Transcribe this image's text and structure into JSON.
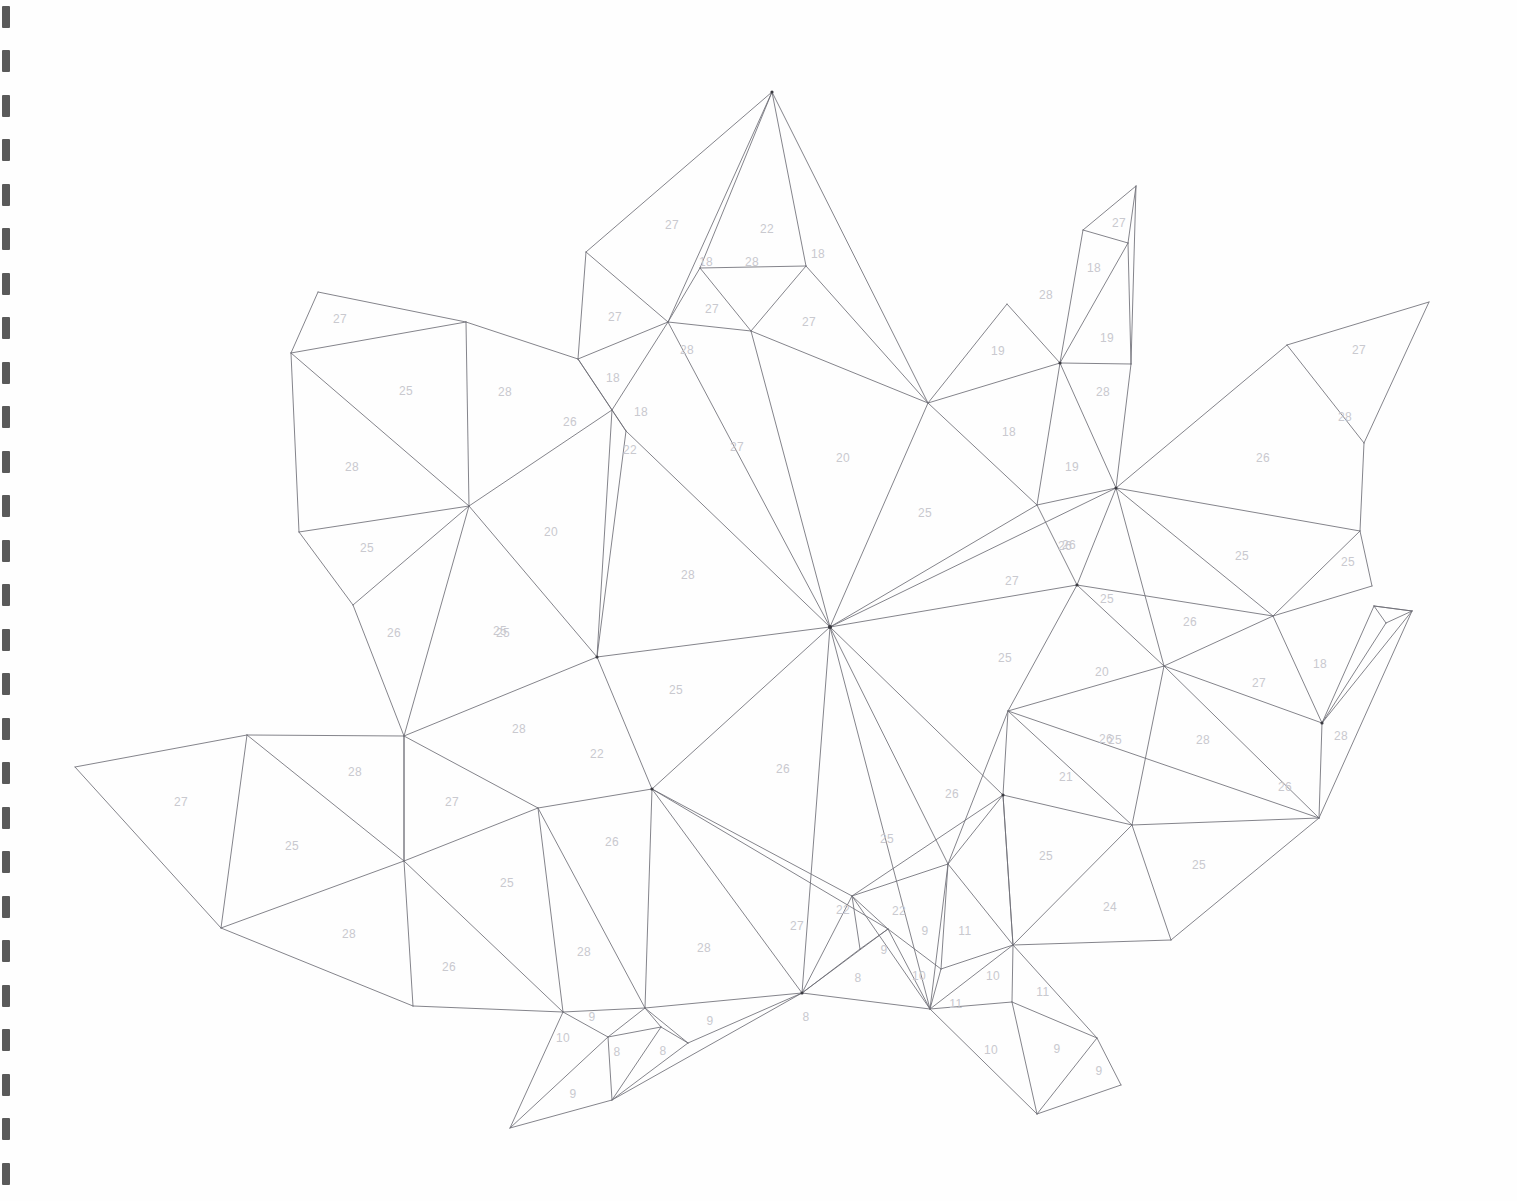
{
  "document": {
    "kind": "low-poly-papercraft-template",
    "subject": "maple-leaf",
    "page_background": "#fefefe",
    "line_color": "#6e6e76",
    "label_color": "#c9c9cf",
    "binding": {
      "side": "left",
      "hole_count": 27,
      "hole_color": "#2b2b2b"
    }
  },
  "chart_data": {
    "type": "diagram",
    "title": "",
    "xlabel": "",
    "ylabel": "",
    "note": "Triangulated unfold pattern; each face carries a numeric fold-group label.",
    "face_labels": [
      {
        "id": "f01",
        "text": "27",
        "x": 672,
        "y": 226
      },
      {
        "id": "f02",
        "text": "22",
        "x": 767,
        "y": 230
      },
      {
        "id": "f03",
        "text": "18",
        "x": 818,
        "y": 255
      },
      {
        "id": "f04",
        "text": "18",
        "x": 706,
        "y": 263
      },
      {
        "id": "f05",
        "text": "28",
        "x": 752,
        "y": 263
      },
      {
        "id": "f06",
        "text": "27",
        "x": 615,
        "y": 318
      },
      {
        "id": "f07",
        "text": "27",
        "x": 712,
        "y": 310
      },
      {
        "id": "f08",
        "text": "27",
        "x": 809,
        "y": 323
      },
      {
        "id": "f09",
        "text": "28",
        "x": 687,
        "y": 351
      },
      {
        "id": "f10",
        "text": "27",
        "x": 340,
        "y": 320
      },
      {
        "id": "f11",
        "text": "25",
        "x": 406,
        "y": 392
      },
      {
        "id": "f12",
        "text": "28",
        "x": 505,
        "y": 393
      },
      {
        "id": "f13",
        "text": "18",
        "x": 613,
        "y": 379
      },
      {
        "id": "f14",
        "text": "26",
        "x": 570,
        "y": 423
      },
      {
        "id": "f15",
        "text": "18",
        "x": 641,
        "y": 413
      },
      {
        "id": "f16",
        "text": "22",
        "x": 630,
        "y": 451
      },
      {
        "id": "f17",
        "text": "28",
        "x": 352,
        "y": 468
      },
      {
        "id": "f18",
        "text": "27",
        "x": 737,
        "y": 448
      },
      {
        "id": "f19",
        "text": "20",
        "x": 843,
        "y": 459
      },
      {
        "id": "f20",
        "text": "25",
        "x": 367,
        "y": 549
      },
      {
        "id": "f21",
        "text": "20",
        "x": 551,
        "y": 533
      },
      {
        "id": "f22",
        "text": "25",
        "x": 925,
        "y": 514
      },
      {
        "id": "f23",
        "text": "26",
        "x": 394,
        "y": 634
      },
      {
        "id": "f24",
        "text": "25",
        "x": 503,
        "y": 634
      },
      {
        "id": "f25",
        "text": "28",
        "x": 688,
        "y": 576
      },
      {
        "id": "f26",
        "text": "25",
        "x": 676,
        "y": 691
      },
      {
        "id": "f27",
        "text": "28",
        "x": 519,
        "y": 730
      },
      {
        "id": "f28",
        "text": "22",
        "x": 597,
        "y": 755
      },
      {
        "id": "f29",
        "text": "26",
        "x": 783,
        "y": 770
      },
      {
        "id": "f30",
        "text": "27",
        "x": 1012,
        "y": 582
      },
      {
        "id": "f31",
        "text": "25",
        "x": 1005,
        "y": 659
      },
      {
        "id": "f32",
        "text": "26",
        "x": 1069,
        "y": 546
      },
      {
        "id": "f33",
        "text": "25",
        "x": 1107,
        "y": 600
      },
      {
        "id": "f34",
        "text": "20",
        "x": 1102,
        "y": 673
      },
      {
        "id": "f35",
        "text": "26",
        "x": 1190,
        "y": 623
      },
      {
        "id": "f36",
        "text": "27",
        "x": 1259,
        "y": 684
      },
      {
        "id": "f37",
        "text": "18",
        "x": 1320,
        "y": 665
      },
      {
        "id": "f38",
        "text": "28",
        "x": 1341,
        "y": 737
      },
      {
        "id": "f39",
        "text": "28",
        "x": 1203,
        "y": 741
      },
      {
        "id": "f40",
        "text": "26",
        "x": 1106,
        "y": 740
      },
      {
        "id": "f41",
        "text": "25",
        "x": 1115,
        "y": 741
      },
      {
        "id": "f42",
        "text": "26",
        "x": 1285,
        "y": 788
      },
      {
        "id": "f43",
        "text": "21",
        "x": 1066,
        "y": 778
      },
      {
        "id": "f44",
        "text": "26",
        "x": 952,
        "y": 795
      },
      {
        "id": "f45",
        "text": "25",
        "x": 887,
        "y": 840
      },
      {
        "id": "f46",
        "text": "25",
        "x": 1046,
        "y": 857
      },
      {
        "id": "f47",
        "text": "25",
        "x": 1199,
        "y": 866
      },
      {
        "id": "f48",
        "text": "24",
        "x": 1110,
        "y": 908
      },
      {
        "id": "f49",
        "text": "19",
        "x": 998,
        "y": 352
      },
      {
        "id": "f50",
        "text": "28",
        "x": 1046,
        "y": 296
      },
      {
        "id": "f51",
        "text": "27",
        "x": 1119,
        "y": 224
      },
      {
        "id": "f52",
        "text": "18",
        "x": 1094,
        "y": 269
      },
      {
        "id": "f53",
        "text": "19",
        "x": 1107,
        "y": 339
      },
      {
        "id": "f54",
        "text": "28",
        "x": 1103,
        "y": 393
      },
      {
        "id": "f55",
        "text": "18",
        "x": 1009,
        "y": 433
      },
      {
        "id": "f56",
        "text": "19",
        "x": 1072,
        "y": 468
      },
      {
        "id": "f57",
        "text": "26",
        "x": 1065,
        "y": 547
      },
      {
        "id": "f58",
        "text": "27",
        "x": 1359,
        "y": 351
      },
      {
        "id": "f59",
        "text": "28",
        "x": 1345,
        "y": 418
      },
      {
        "id": "f60",
        "text": "26",
        "x": 1263,
        "y": 459
      },
      {
        "id": "f61",
        "text": "25",
        "x": 1242,
        "y": 557
      },
      {
        "id": "f62",
        "text": "25",
        "x": 1348,
        "y": 563
      },
      {
        "id": "f63",
        "text": "27",
        "x": 181,
        "y": 803
      },
      {
        "id": "f64",
        "text": "25",
        "x": 292,
        "y": 847
      },
      {
        "id": "f65",
        "text": "28",
        "x": 355,
        "y": 773
      },
      {
        "id": "f66",
        "text": "27",
        "x": 452,
        "y": 803
      },
      {
        "id": "f67",
        "text": "26",
        "x": 612,
        "y": 843
      },
      {
        "id": "f68",
        "text": "28",
        "x": 349,
        "y": 935
      },
      {
        "id": "f69",
        "text": "25",
        "x": 507,
        "y": 884
      },
      {
        "id": "f70",
        "text": "26",
        "x": 449,
        "y": 968
      },
      {
        "id": "f71",
        "text": "28",
        "x": 584,
        "y": 953
      },
      {
        "id": "f72",
        "text": "28",
        "x": 704,
        "y": 949
      },
      {
        "id": "f73",
        "text": "27",
        "x": 797,
        "y": 927
      },
      {
        "id": "f74",
        "text": "22",
        "x": 843,
        "y": 911
      },
      {
        "id": "f75",
        "text": "22",
        "x": 899,
        "y": 912
      },
      {
        "id": "f76",
        "text": "9",
        "x": 925,
        "y": 932
      },
      {
        "id": "f77",
        "text": "11",
        "x": 965,
        "y": 932
      },
      {
        "id": "f78",
        "text": "9",
        "x": 884,
        "y": 951
      },
      {
        "id": "f79",
        "text": "8",
        "x": 858,
        "y": 979
      },
      {
        "id": "f80",
        "text": "10",
        "x": 919,
        "y": 977
      },
      {
        "id": "f81",
        "text": "10",
        "x": 993,
        "y": 977
      },
      {
        "id": "f82",
        "text": "11",
        "x": 956,
        "y": 1005
      },
      {
        "id": "f83",
        "text": "11",
        "x": 1043,
        "y": 993
      },
      {
        "id": "f84",
        "text": "10",
        "x": 991,
        "y": 1051
      },
      {
        "id": "f85",
        "text": "9",
        "x": 1057,
        "y": 1050
      },
      {
        "id": "f86",
        "text": "9",
        "x": 1099,
        "y": 1072
      },
      {
        "id": "f87",
        "text": "10",
        "x": 563,
        "y": 1039
      },
      {
        "id": "f88",
        "text": "9",
        "x": 592,
        "y": 1018
      },
      {
        "id": "f89",
        "text": "8",
        "x": 617,
        "y": 1053
      },
      {
        "id": "f90",
        "text": "8",
        "x": 663,
        "y": 1052
      },
      {
        "id": "f91",
        "text": "9",
        "x": 710,
        "y": 1022
      },
      {
        "id": "f92",
        "text": "8",
        "x": 806,
        "y": 1018
      },
      {
        "id": "f93",
        "text": "9",
        "x": 573,
        "y": 1095
      },
      {
        "id": "f94",
        "text": "25",
        "x": 500,
        "y": 632
      }
    ]
  }
}
